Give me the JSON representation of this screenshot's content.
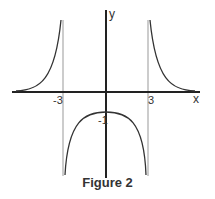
{
  "figure": {
    "caption": "Figure 2",
    "axes": {
      "x_label": "x",
      "y_label": "y"
    },
    "ticks": {
      "neg3": "-3",
      "pos3": "3",
      "neg1": "-1"
    },
    "asymptotes": [
      -3,
      3
    ],
    "colors": {
      "curve": "#333333",
      "axis": "#222222",
      "asymptote": "#999999"
    }
  }
}
